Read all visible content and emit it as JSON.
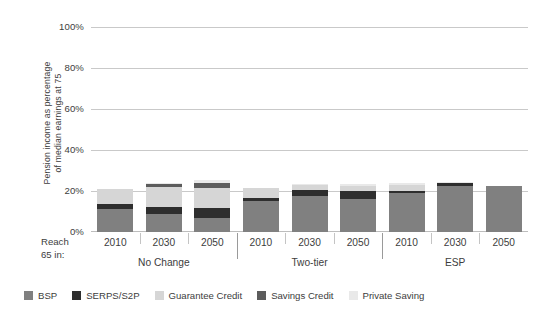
{
  "chart_data": {
    "type": "bar",
    "subtype": "stacked-bar-grouped",
    "title": "",
    "xlabel": "Reach 65 in:",
    "ylabel": "Pension income as percentage of median earnings at 75",
    "ylim": [
      0,
      100
    ],
    "ytick_labels": [
      "0%",
      "20%",
      "40%",
      "60%",
      "80%",
      "100%"
    ],
    "ytick_values": [
      0,
      20,
      40,
      60,
      80,
      100
    ],
    "grid": true,
    "legend_position": "bottom",
    "groups": [
      "No Change",
      "Two-tier",
      "ESP"
    ],
    "categories": [
      "2010",
      "2030",
      "2050",
      "2010",
      "2030",
      "2050",
      "2010",
      "2030",
      "2050"
    ],
    "series": [
      {
        "name": "BSP",
        "color": "#808080",
        "values": [
          11.5,
          9.0,
          7.0,
          15.0,
          17.5,
          16.0,
          19.0,
          22.5,
          22.5
        ]
      },
      {
        "name": "SERPS/S2P",
        "color": "#2e2e2e",
        "values": [
          2.0,
          3.5,
          5.0,
          1.5,
          3.0,
          4.0,
          1.0,
          1.5,
          0.0
        ]
      },
      {
        "name": "Guarantee Credit",
        "color": "#d6d6d6",
        "values": [
          7.5,
          9.5,
          9.5,
          5.0,
          2.5,
          2.5,
          3.0,
          0.0,
          0.0
        ]
      },
      {
        "name": "Savings Credit",
        "color": "#5c5c5c",
        "values": [
          0.0,
          1.5,
          2.5,
          0.0,
          0.0,
          0.0,
          0.0,
          0.0,
          0.0
        ]
      },
      {
        "name": "Private Saving",
        "color": "#e9e9e9",
        "values": [
          0.0,
          0.5,
          1.5,
          0.0,
          0.5,
          1.0,
          1.0,
          0.5,
          0.0
        ]
      }
    ],
    "bar_totals": [
      21.0,
      24.0,
      25.5,
      21.5,
      23.5,
      23.5,
      24.0,
      24.5,
      22.5
    ]
  },
  "axis": {
    "y_title_line1": "Pension income as percentage",
    "y_title_line2": "of median earnings at 75",
    "x_title_line1": "Reach",
    "x_title_line2": "65 in:"
  },
  "colors": {
    "grid": "#c9c9c9",
    "text": "#3d3d3d",
    "separator": "#9a9a9a",
    "bsp": "#808080",
    "serps": "#2e2e2e",
    "guarantee": "#d6d6d6",
    "savings": "#5c5c5c",
    "private": "#e9e9e9"
  }
}
